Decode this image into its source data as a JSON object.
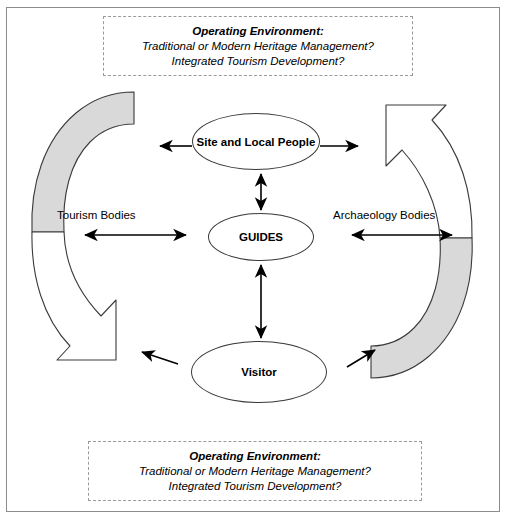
{
  "diagram": {
    "colors": {
      "arc_fill": "#d9d9d9",
      "arc_stroke": "#3a3a3a",
      "node_stroke": "#3a3a3a",
      "frame_stroke": "#8c8c8c",
      "box_stroke": "#9a9a9a",
      "arrow": "#000000",
      "background": "#ffffff"
    },
    "environment_top": {
      "title": "Operating Environment:",
      "line1": "Traditional or Modern Heritage Management?",
      "line2": "Integrated Tourism Development?"
    },
    "environment_bottom": {
      "title": "Operating Environment:",
      "line1": "Traditional or Modern Heritage Management?",
      "line2": "Integrated Tourism Development?"
    },
    "nodes": {
      "site": "Site and Local People",
      "guides": "GUIDES",
      "visitor": "Visitor"
    },
    "side_labels": {
      "left": "Tourism Bodies",
      "right": "Archaeology Bodies"
    },
    "connectors": [
      {
        "name": "site-to-left",
        "style": "single-head-left"
      },
      {
        "name": "site-to-right",
        "style": "single-head-right"
      },
      {
        "name": "site-to-guides",
        "style": "double-head-vertical"
      },
      {
        "name": "guides-to-visitor",
        "style": "double-head-vertical"
      },
      {
        "name": "tourism-bodies-arrow",
        "style": "double-head-horizontal"
      },
      {
        "name": "archaeology-bodies-arrow",
        "style": "double-head-horizontal"
      },
      {
        "name": "visitor-to-left-arc",
        "style": "single-head-upleft"
      },
      {
        "name": "visitor-to-right-arc",
        "style": "single-head-upright"
      }
    ],
    "arcs": [
      {
        "name": "left-upper-arc",
        "fill": "shaded",
        "tip": "flat"
      },
      {
        "name": "left-lower-arc",
        "fill": "white",
        "tip": "arrowhead"
      },
      {
        "name": "right-upper-arc",
        "fill": "white",
        "tip": "arrowhead"
      },
      {
        "name": "right-lower-arc",
        "fill": "shaded",
        "tip": "flat"
      }
    ]
  }
}
